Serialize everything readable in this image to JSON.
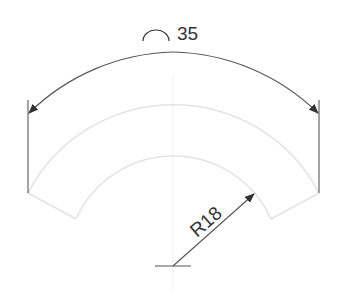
{
  "drawing": {
    "arc_dimension_symbol": "arc-length-symbol",
    "arc_dimension_value": "35",
    "radius_label": "R18"
  },
  "colors": {
    "dimension_line": "#444444",
    "part_outline": "#e3e3e3",
    "center_line": "#eeeeee",
    "text": "#333333"
  }
}
